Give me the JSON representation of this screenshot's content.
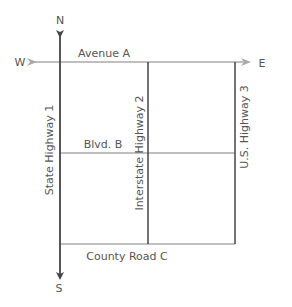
{
  "diagram": {
    "type": "road-map",
    "compass": {
      "north": "N",
      "south": "S",
      "east": "E",
      "west": "W"
    },
    "roads": {
      "avenue_a": "Avenue A",
      "blvd_b": "Blvd. B",
      "county_road_c": "County Road C",
      "state_highway_1": "State Highway 1",
      "interstate_highway_2": "Interstate Highway 2",
      "us_highway_3": "U.S. Highway 3"
    },
    "colors": {
      "ns_axis": "#444444",
      "ew_axis": "#aaaaaa",
      "highway": "#444444",
      "minor_road": "#aaaaaa",
      "label": "#555555"
    }
  }
}
